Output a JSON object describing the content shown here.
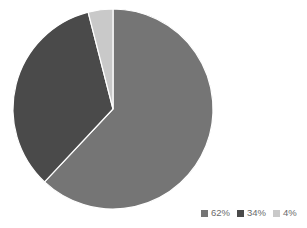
{
  "chart_data": {
    "type": "pie",
    "title": "",
    "subtitle": "",
    "xlabel": "",
    "ylabel": "",
    "grid": false,
    "legend_position": "bottom-right",
    "legend_orientation": "horizontal",
    "background_color": "#ffffff",
    "center": {
      "x": 113,
      "y": 109
    },
    "radius": 100,
    "start_angle_deg": 0,
    "direction": "clockwise",
    "categories": [
      "62%",
      "34%",
      "4%"
    ],
    "values": [
      62,
      34,
      4
    ],
    "labels": [
      "62%",
      "34%",
      "4%"
    ],
    "colors": [
      "#757575",
      "#4a4a4a",
      "#c9c9c9"
    ],
    "slices": [
      {
        "label": "62%",
        "value": 62,
        "color": "#757575",
        "start_deg": 0,
        "end_deg": 223.2
      },
      {
        "label": "34%",
        "value": 34,
        "color": "#4a4a4a",
        "start_deg": 223.2,
        "end_deg": 345.6
      },
      {
        "label": "4%",
        "value": 4,
        "color": "#c9c9c9",
        "start_deg": 345.6,
        "end_deg": 360
      }
    ]
  },
  "legend": {
    "items": [
      {
        "label": "62%",
        "color": "#757575"
      },
      {
        "label": "34%",
        "color": "#4a4a4a"
      },
      {
        "label": "4%",
        "color": "#c9c9c9"
      }
    ]
  }
}
